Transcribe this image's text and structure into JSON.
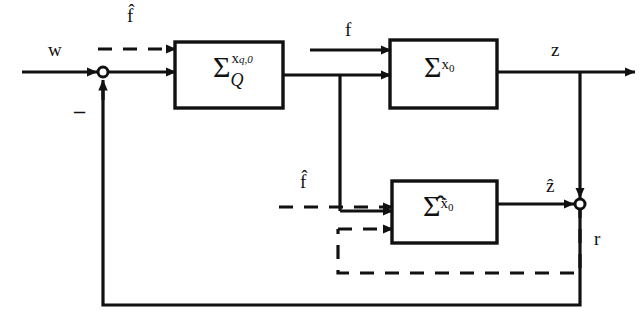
{
  "diagram": {
    "type": "control-block-diagram",
    "colors": {
      "line": "#111111",
      "background": "#ffffff",
      "text": "#111111"
    },
    "blocks": [
      {
        "id": "quantized-plant",
        "name": "sigma-q-block",
        "symbol": "Σ",
        "superscript": "x",
        "superscript_sub": "q,0",
        "subscript": "Q",
        "x": 175,
        "y": 42,
        "width": 108,
        "height": 66
      },
      {
        "id": "plant",
        "name": "sigma-x0-block",
        "symbol": "Σ",
        "superscript": "x",
        "superscript_sub": "0",
        "subscript": "",
        "x": 390,
        "y": 40,
        "width": 107,
        "height": 68
      },
      {
        "id": "observer",
        "name": "sigma-hat-block",
        "symbol": "Σ̂",
        "superscript": "x̂",
        "superscript_sub": "0",
        "subscript": "",
        "x": 392,
        "y": 181,
        "width": 105,
        "height": 62
      }
    ],
    "junctions": [
      {
        "id": "input-sum",
        "name": "input-summing-junction",
        "cx": 103,
        "cy": 72,
        "r": 5
      },
      {
        "id": "error-sum",
        "name": "error-summing-junction",
        "cx": 580,
        "cy": 204,
        "r": 5
      }
    ],
    "labels": [
      {
        "id": "w",
        "name": "signal-label-w",
        "text": "w",
        "x": 48,
        "y": 40,
        "style": "plain"
      },
      {
        "id": "minus",
        "name": "sign-label-minus",
        "text": "–",
        "x": 74,
        "y": 103,
        "style": "minus"
      },
      {
        "id": "fhat-top",
        "name": "signal-label-f-hat-top",
        "text": "f̂",
        "x": 127,
        "y": 6,
        "style": "hat"
      },
      {
        "id": "f",
        "name": "signal-label-f",
        "text": "f",
        "x": 345,
        "y": 22,
        "style": "plain"
      },
      {
        "id": "z",
        "name": "signal-label-z",
        "text": "z",
        "x": 551,
        "y": 40,
        "style": "plain"
      },
      {
        "id": "fhat-bottom",
        "name": "signal-label-f-hat-bottom",
        "text": "f̂",
        "x": 300,
        "y": 172,
        "style": "hat"
      },
      {
        "id": "zhat",
        "name": "signal-label-z-hat",
        "text": "ẑ",
        "x": 545,
        "y": 176,
        "style": "hat"
      },
      {
        "id": "r",
        "name": "signal-label-r",
        "text": "r",
        "x": 594,
        "y": 230,
        "style": "plain"
      }
    ],
    "signals": [
      {
        "name": "w-input",
        "style": "solid",
        "from": "exterior-left",
        "to": "input-sum"
      },
      {
        "name": "f-hat-disturbance-to-plant",
        "style": "dashed",
        "from": "exterior-left",
        "to": "quantized-plant"
      },
      {
        "name": "control-to-plant",
        "style": "solid",
        "from": "quantized-plant",
        "to": "plant"
      },
      {
        "name": "control-branch-to-observer",
        "style": "solid",
        "from": "quantized-plant",
        "to": "observer"
      },
      {
        "name": "f-hat-disturbance-to-observer",
        "style": "dashed",
        "from": "exterior-left",
        "to": "observer"
      },
      {
        "name": "z-output",
        "style": "solid",
        "from": "plant",
        "to": "exterior-right"
      },
      {
        "name": "z-to-error-sum",
        "style": "solid",
        "from": "plant",
        "to": "error-sum"
      },
      {
        "name": "z-hat-to-error-sum",
        "style": "solid",
        "from": "observer",
        "to": "error-sum"
      },
      {
        "name": "residual-feedback-solid",
        "style": "solid",
        "from": "error-sum",
        "to": "input-sum"
      },
      {
        "name": "residual-feedback-dashed",
        "style": "dashed",
        "from": "error-sum",
        "to": "observer"
      }
    ]
  }
}
